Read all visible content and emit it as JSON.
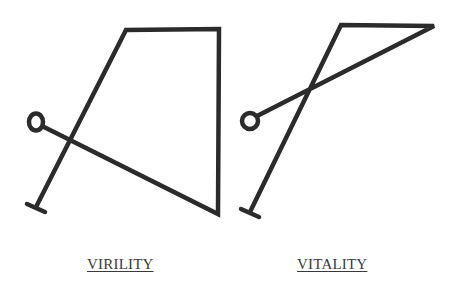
{
  "stroke_color": "#2b2b2b",
  "figures": [
    {
      "id": "left",
      "label": "VIRILITY",
      "shape": "quadrilateral-loop",
      "points": {
        "circle_center": [
          36,
          122
        ],
        "crossing": [
          72,
          142
        ],
        "top_left": [
          126,
          30
        ],
        "top_right": [
          219,
          29
        ],
        "bottom_right": [
          218,
          214
        ],
        "foot_end": [
          36,
          207
        ],
        "foot_bar": [
          [
            28,
            204
          ],
          [
            45,
            212
          ]
        ]
      }
    },
    {
      "id": "right",
      "label": "VITALITY",
      "shape": "triangle-loop",
      "points": {
        "circle_center": [
          250,
          120
        ],
        "crossing": [
          308,
          89
        ],
        "top_left": [
          341,
          25
        ],
        "top_right": [
          434,
          26
        ],
        "foot_end": [
          250,
          212
        ],
        "foot_bar": [
          [
            241,
            209
          ],
          [
            259,
            217
          ]
        ]
      }
    }
  ],
  "labels": {
    "left": "VIRILITY",
    "right": "VITALITY"
  }
}
